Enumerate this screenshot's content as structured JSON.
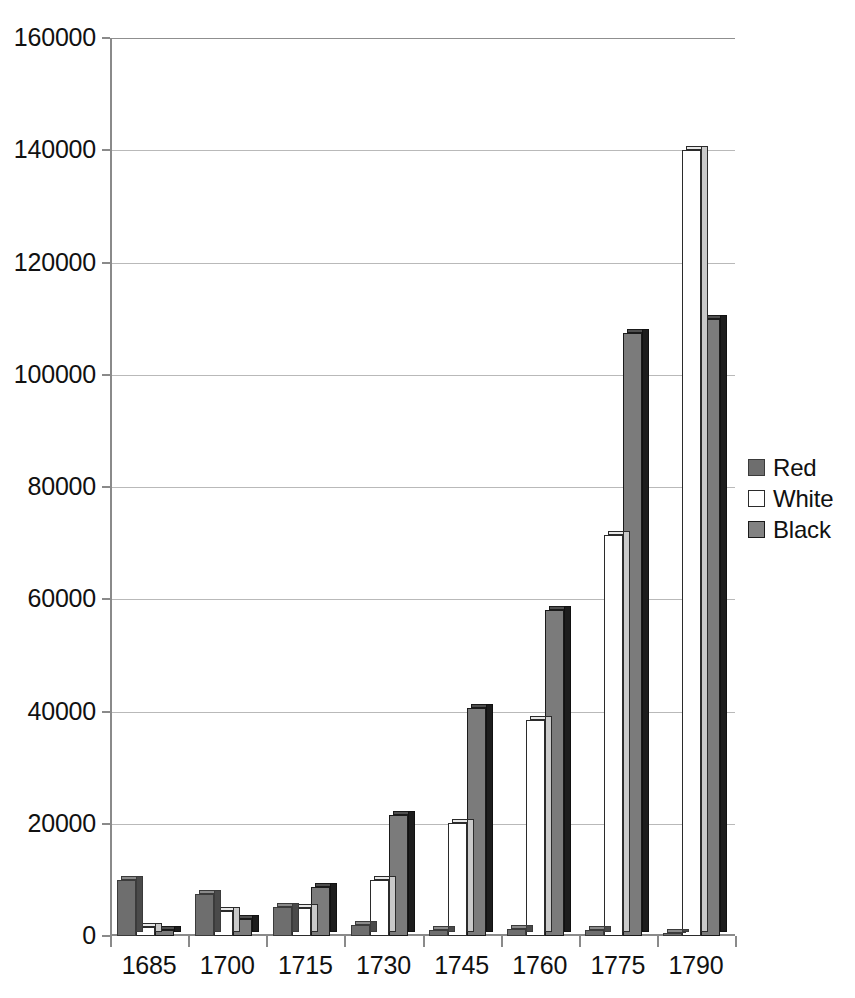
{
  "chart_data": {
    "type": "bar",
    "title": "",
    "subtitle": "",
    "xlabel": "",
    "ylabel": "",
    "categories": [
      "1685",
      "1700",
      "1715",
      "1730",
      "1745",
      "1760",
      "1775",
      "1790"
    ],
    "series": [
      {
        "name": "Red",
        "color": "#6e6e6e",
        "values": [
          10000,
          7500,
          5200,
          2000,
          1000,
          1300,
          1100,
          600
        ]
      },
      {
        "name": "White",
        "color": "#ffffff",
        "values": [
          1600,
          4500,
          5000,
          10000,
          20200,
          38500,
          71500,
          140000
        ]
      },
      {
        "name": "Black",
        "color": "#7b7b7b",
        "values": [
          1100,
          3000,
          8700,
          21500,
          40700,
          58000,
          107500,
          110000
        ]
      }
    ],
    "ylim": [
      0,
      160000
    ],
    "ytick_values": [
      0,
      20000,
      40000,
      60000,
      80000,
      100000,
      120000,
      140000,
      160000
    ],
    "ytick_labels": [
      "0",
      "20000",
      "40000",
      "60000",
      "80000",
      "100000",
      "120000",
      "140000",
      "160000"
    ],
    "grid": true,
    "grid_axis": "y",
    "legend_position": "right",
    "legend_entries": [
      "Red",
      "White",
      "Black"
    ],
    "bar_style": "3d-clustered"
  }
}
